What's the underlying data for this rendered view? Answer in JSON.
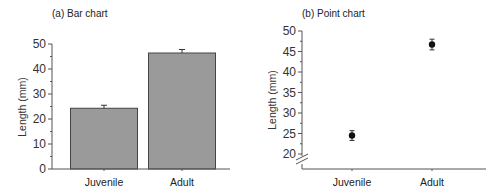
{
  "chart_data": [
    {
      "type": "bar",
      "title": "(a) Bar chart",
      "categories": [
        "Juvenile",
        "Adult"
      ],
      "values": [
        24.3,
        46.4
      ],
      "error": [
        1.2,
        1.4
      ],
      "xlabel": "",
      "ylabel": "Length (mm)",
      "ylim": [
        0,
        50
      ],
      "yticks": [
        0,
        10,
        20,
        30,
        40,
        50
      ],
      "ytick_labels": [
        "0",
        "10",
        "20",
        "30",
        "40",
        "50"
      ],
      "bar_color": "#9a9a9a",
      "grid": false
    },
    {
      "type": "scatter",
      "title": "(b) Point chart",
      "categories": [
        "Juvenile",
        "Adult"
      ],
      "values": [
        24.5,
        46.7
      ],
      "error": [
        1.2,
        1.3
      ],
      "xlabel": "",
      "ylabel": "Length (mm)",
      "ylim": [
        20,
        50
      ],
      "axis_break": true,
      "yticks": [
        20,
        25,
        30,
        35,
        40,
        45,
        50
      ],
      "ytick_labels": [
        "20",
        "25",
        "30",
        "35",
        "40",
        "45",
        "50"
      ],
      "marker_color": "#111111",
      "grid": false
    }
  ]
}
